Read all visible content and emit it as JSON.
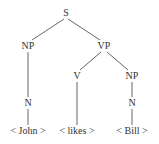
{
  "diagram": {
    "type": "syntax-tree",
    "nodes": {
      "s": {
        "label": "S",
        "x": 66,
        "y": 13
      },
      "np_left": {
        "label": "NP",
        "x": 28,
        "y": 46
      },
      "vp": {
        "label": "VP",
        "x": 104,
        "y": 46
      },
      "n_left": {
        "label": "N",
        "x": 28,
        "y": 103
      },
      "v": {
        "label": "V",
        "x": 77,
        "y": 76
      },
      "np_right": {
        "label": "NP",
        "x": 132,
        "y": 76
      },
      "n_right": {
        "label": "N",
        "x": 132,
        "y": 103
      },
      "leaf_john": {
        "label": "< John >",
        "x": 28,
        "y": 131
      },
      "leaf_likes": {
        "label": "< likes >",
        "x": 77,
        "y": 131
      },
      "leaf_bill": {
        "label": "< Bill >",
        "x": 132,
        "y": 131
      }
    },
    "edges": [
      [
        "s",
        "np_left"
      ],
      [
        "s",
        "vp"
      ],
      [
        "np_left",
        "n_left"
      ],
      [
        "n_left",
        "leaf_john"
      ],
      [
        "vp",
        "v"
      ],
      [
        "vp",
        "np_right"
      ],
      [
        "v",
        "leaf_likes"
      ],
      [
        "np_right",
        "n_right"
      ],
      [
        "n_right",
        "leaf_bill"
      ]
    ],
    "colors": {
      "text": "#333333",
      "line": "#555555",
      "background": "#ffffff"
    }
  }
}
